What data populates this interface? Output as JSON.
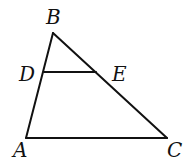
{
  "diagram": {
    "type": "triangle",
    "points": {
      "A": {
        "x": 26,
        "y": 138
      },
      "B": {
        "x": 53,
        "y": 33
      },
      "C": {
        "x": 167,
        "y": 138
      },
      "D": {
        "x": 44,
        "y": 72
      },
      "E": {
        "x": 96,
        "y": 72
      }
    },
    "segments": [
      [
        "A",
        "B"
      ],
      [
        "B",
        "C"
      ],
      [
        "A",
        "C"
      ],
      [
        "D",
        "E"
      ]
    ],
    "labels": {
      "A": "A",
      "B": "B",
      "C": "C",
      "D": "D",
      "E": "E"
    }
  }
}
